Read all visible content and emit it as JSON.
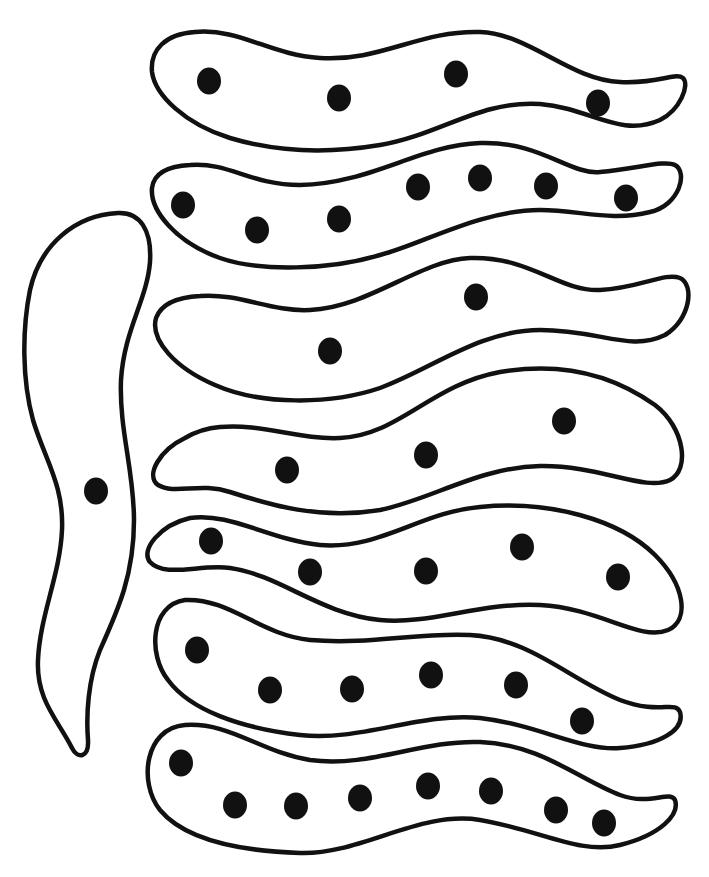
{
  "figure": {
    "width": 709,
    "height": 877,
    "background": "#ffffff",
    "ink_color": "#111111",
    "dot_radius": 12
  },
  "shapes": [
    {
      "id": "vertical-worm",
      "path": "M118 213 C 140 212, 152 230, 150 262 C 147 300, 124 330, 121 380 C 119 430, 134 470, 134 520 C 134 575, 118 610, 100 650 C 88 680, 86 715, 88 740 C 89 757, 78 760, 72 748 C 58 720, 36 700, 38 660 C 40 615, 60 575, 62 530 C 64 485, 45 460, 33 420 C 22 380, 22 330, 30 290 C 40 245, 75 215, 118 213 Z",
      "dots": [
        [
          96,
          491
        ]
      ]
    },
    {
      "id": "worm-1",
      "path": "M195 32 C 240 28, 270 55, 320 58 C 380 62, 420 30, 480 32 C 530 34, 570 80, 620 82 C 660 84, 675 72, 683 78 C 690 85, 680 110, 660 120 C 620 138, 590 108, 540 104 C 480 100, 440 135, 380 145 C 320 155, 270 150, 230 138 C 185 124, 155 95, 152 72 C 150 50, 165 34, 195 32 Z",
      "dots": [
        [
          209,
          81
        ],
        [
          339,
          98
        ],
        [
          456,
          74
        ],
        [
          598,
          103
        ]
      ]
    },
    {
      "id": "worm-2",
      "path": "M190 165 C 230 162, 250 185, 300 185 C 370 184, 420 145, 480 143 C 540 141, 570 175, 600 172 C 640 168, 665 160, 675 165 C 688 172, 680 205, 650 212 C 610 222, 580 210, 540 210 C 480 210, 420 245, 380 255 C 330 270, 260 272, 220 258 C 175 242, 150 210, 152 188 C 154 172, 170 166, 190 165 Z",
      "dots": [
        [
          183,
          205
        ],
        [
          257,
          230
        ],
        [
          339,
          219
        ],
        [
          418,
          187
        ],
        [
          480,
          178
        ],
        [
          546,
          186
        ],
        [
          626,
          198
        ]
      ]
    },
    {
      "id": "worm-3",
      "path": "M200 296 C 240 293, 270 312, 310 310 C 370 307, 420 260, 470 258 C 530 256, 560 292, 600 290 C 640 288, 665 272, 680 278 C 695 285, 690 320, 665 335 C 630 352, 600 330, 540 330 C 480 330, 430 370, 380 388 C 330 405, 260 405, 215 385 C 175 368, 150 340, 156 318 C 162 302, 180 297, 200 296 Z",
      "dots": [
        [
          330,
          351
        ],
        [
          476,
          297
        ]
      ]
    },
    {
      "id": "worm-4",
      "path": "M220 427 C 260 423, 300 440, 340 438 C 400 435, 430 385, 500 372 C 570 360, 620 380, 655 405 C 685 428, 690 470, 670 480 C 645 492, 600 465, 540 466 C 480 467, 430 500, 380 510 C 320 520, 270 505, 230 492 C 200 482, 175 495, 158 485 C 145 475, 160 450, 185 438 C 195 432, 208 428, 220 427 Z",
      "dots": [
        [
          287,
          470
        ],
        [
          426,
          455
        ],
        [
          564,
          421
        ]
      ]
    },
    {
      "id": "worm-5",
      "path": "M190 518 C 230 512, 270 540, 320 545 C 380 550, 420 512, 480 507 C 550 500, 620 520, 655 555 C 685 585, 690 620, 668 630 C 640 642, 600 608, 540 605 C 480 602, 430 625, 380 620 C 320 614, 280 575, 230 568 C 200 564, 165 578, 150 562 C 140 550, 160 525, 190 518 Z",
      "dots": [
        [
          211,
          541
        ],
        [
          310,
          572
        ],
        [
          426,
          571
        ],
        [
          522,
          547
        ],
        [
          618,
          577
        ]
      ]
    },
    {
      "id": "worm-6",
      "path": "M185 600 C 230 598, 260 635, 310 640 C 370 645, 420 632, 470 635 C 530 638, 570 680, 620 700 C 660 715, 675 700, 680 712 C 685 730, 660 745, 620 748 C 580 751, 540 725, 480 718 C 420 712, 360 742, 300 735 C 240 728, 190 710, 168 680 C 148 655, 150 605, 185 600 Z",
      "dots": [
        [
          197,
          650
        ],
        [
          270,
          690
        ],
        [
          352,
          689
        ],
        [
          431,
          675
        ],
        [
          516,
          685
        ],
        [
          582,
          721
        ]
      ]
    },
    {
      "id": "worm-7",
      "path": "M185 725 C 230 722, 260 752, 310 760 C 370 768, 420 740, 480 742 C 540 744, 580 780, 620 795 C 650 806, 670 790, 675 800 C 680 815, 660 835, 620 845 C 580 855, 540 830, 480 820 C 420 810, 360 855, 300 853 C 240 851, 185 840, 160 810 C 138 782, 145 728, 185 725 Z",
      "dots": [
        [
          181,
          763
        ],
        [
          235,
          805
        ],
        [
          296,
          806
        ],
        [
          360,
          798
        ],
        [
          428,
          786
        ],
        [
          491,
          791
        ],
        [
          556,
          810
        ],
        [
          604,
          823
        ]
      ]
    }
  ]
}
